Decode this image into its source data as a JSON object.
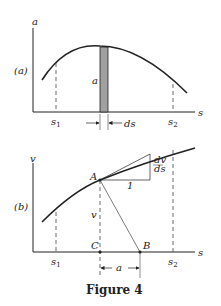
{
  "figure": {
    "caption": "Figure 4",
    "panel_a": {
      "tag": "(a)",
      "y_axis_label": "a",
      "x_axis_label": "s",
      "strip_label": "a",
      "width_label": "ds",
      "s1_label": "s",
      "s1_sub": "1",
      "s2_label": "s",
      "s2_sub": "2"
    },
    "panel_b": {
      "tag": "(b)",
      "y_axis_label": "v",
      "x_axis_label": "s",
      "point_A": "A",
      "point_B": "B",
      "point_C": "C",
      "height_label": "v",
      "slope_num": "dv",
      "slope_den": "ds",
      "run_label": "1",
      "dimension_label": "a",
      "s1_label": "s",
      "s1_sub": "1",
      "s2_label": "s",
      "s2_sub": "2"
    }
  },
  "colors": {
    "ink": "#222222",
    "strip": "#a0a0a0"
  }
}
